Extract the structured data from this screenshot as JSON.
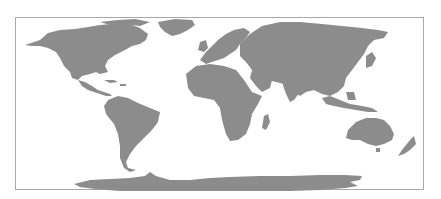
{
  "map": {
    "type": "world-map",
    "projection": "equirectangular",
    "land_color": "#8c8c8c",
    "water_color": "#ffffff",
    "border_color": "#a8a8a8",
    "regions": [
      "North America",
      "Greenland",
      "South America",
      "Europe",
      "Africa",
      "Madagascar",
      "Asia",
      "Japan",
      "Indonesia",
      "Australia",
      "New Zealand",
      "Antarctica"
    ]
  }
}
